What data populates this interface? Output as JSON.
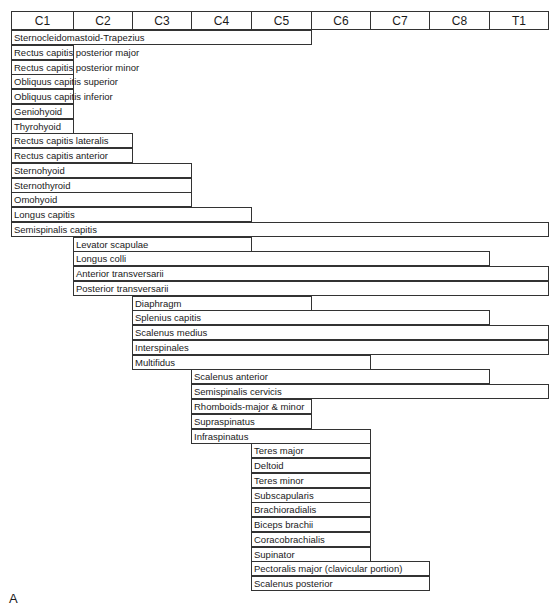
{
  "chart_data": {
    "type": "table",
    "panel_label": "A",
    "columns": [
      "C1",
      "C2",
      "C3",
      "C4",
      "C5",
      "C6",
      "C7",
      "C8",
      "T1"
    ],
    "rows": [
      {
        "label": "Sternocleidomastoid-Trapezius",
        "start": "C1",
        "end": "C5"
      },
      {
        "label": "Rectus capitis posterior major",
        "start": "C1",
        "end": "C1"
      },
      {
        "label": "Rectus capitis posterior minor",
        "start": "C1",
        "end": "C1"
      },
      {
        "label": "Obliquus capitis superior",
        "start": "C1",
        "end": "C1"
      },
      {
        "label": "Obliquus capitis inferior",
        "start": "C1",
        "end": "C1"
      },
      {
        "label": "Geniohyoid",
        "start": "C1",
        "end": "C1"
      },
      {
        "label": "Thyrohyoid",
        "start": "C1",
        "end": "C1"
      },
      {
        "label": "Rectus capitis lateralis",
        "start": "C1",
        "end": "C2"
      },
      {
        "label": "Rectus capitis anterior",
        "start": "C1",
        "end": "C2"
      },
      {
        "label": "Sternohyoid",
        "start": "C1",
        "end": "C3"
      },
      {
        "label": "Sternothyroid",
        "start": "C1",
        "end": "C3"
      },
      {
        "label": "Omohyoid",
        "start": "C1",
        "end": "C3"
      },
      {
        "label": "Longus capitis",
        "start": "C1",
        "end": "C4"
      },
      {
        "label": "Semispinalis capitis",
        "start": "C1",
        "end": "T1"
      },
      {
        "label": "Levator scapulae",
        "start": "C2",
        "end": "C4"
      },
      {
        "label": "Longus colli",
        "start": "C2",
        "end": "C8"
      },
      {
        "label": "Anterior transversarii",
        "start": "C2",
        "end": "T1"
      },
      {
        "label": "Posterior transversarii",
        "start": "C2",
        "end": "T1"
      },
      {
        "label": "Diaphragm",
        "start": "C3",
        "end": "C5"
      },
      {
        "label": "Splenius capitis",
        "start": "C3",
        "end": "C8"
      },
      {
        "label": "Scalenus medius",
        "start": "C3",
        "end": "T1"
      },
      {
        "label": "Interspinales",
        "start": "C3",
        "end": "T1"
      },
      {
        "label": "Multifidus",
        "start": "C3",
        "end": "C6"
      },
      {
        "label": "Scalenus anterior",
        "start": "C4",
        "end": "C8"
      },
      {
        "label": "Semispinalis cervicis",
        "start": "C4",
        "end": "T1"
      },
      {
        "label": "Rhomboids-major & minor",
        "start": "C4",
        "end": "C5"
      },
      {
        "label": "Supraspinatus",
        "start": "C4",
        "end": "C5"
      },
      {
        "label": "Infraspinatus",
        "start": "C4",
        "end": "C6"
      },
      {
        "label": "Teres major",
        "start": "C5",
        "end": "C6"
      },
      {
        "label": "Deltoid",
        "start": "C5",
        "end": "C6"
      },
      {
        "label": "Teres minor",
        "start": "C5",
        "end": "C6"
      },
      {
        "label": "Subscapularis",
        "start": "C5",
        "end": "C6"
      },
      {
        "label": "Brachioradialis",
        "start": "C5",
        "end": "C6"
      },
      {
        "label": "Biceps brachii",
        "start": "C5",
        "end": "C6"
      },
      {
        "label": "Coracobrachialis",
        "start": "C5",
        "end": "C6"
      },
      {
        "label": "Supinator",
        "start": "C5",
        "end": "C6"
      },
      {
        "label": "Pectoralis major (clavicular portion)",
        "start": "C5",
        "end": "C7"
      },
      {
        "label": "Scalenus posterior",
        "start": "C5",
        "end": "C7"
      }
    ],
    "grid": false,
    "legend": null
  }
}
